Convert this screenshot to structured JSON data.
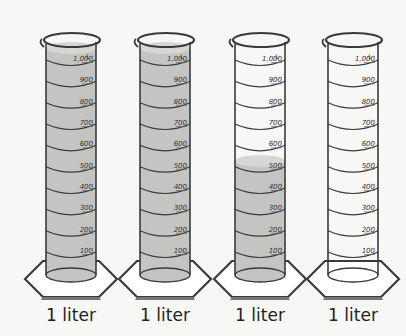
{
  "figure": {
    "title": "",
    "colors": {
      "background": "#f7f7f5",
      "liquid": "#c4c4c2",
      "liquid_top": "#d6d6d4",
      "outline": "#3a3a3a",
      "base_fill": "#ffffff"
    },
    "scale": {
      "unit": "L",
      "ticks": [
        "1,000",
        "900",
        "800",
        "700",
        "600",
        "500",
        "400",
        "300",
        "200",
        "100"
      ]
    },
    "cylinders": [
      {
        "label": "1 liter",
        "fill_ml": 1000
      },
      {
        "label": "1 liter",
        "fill_ml": 1000
      },
      {
        "label": "1 liter",
        "fill_ml": 550
      },
      {
        "label": "1 liter",
        "fill_ml": 0
      }
    ]
  }
}
